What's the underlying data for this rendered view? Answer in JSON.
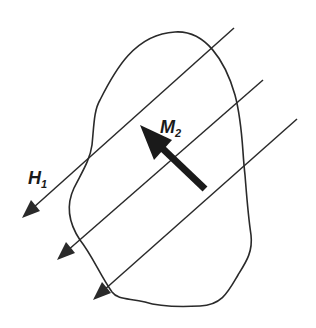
{
  "diagram": {
    "labels": {
      "field": "H",
      "field_sub": "1",
      "moment": "M",
      "moment_sub": "2"
    },
    "colors": {
      "stroke": "#2a2a2a",
      "arrow_fill": "#1a1a1a",
      "background": "#ffffff"
    },
    "field_lines_count": 3
  }
}
